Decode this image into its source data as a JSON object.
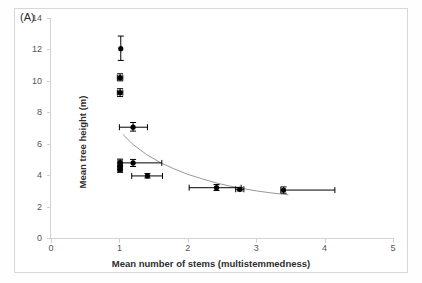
{
  "figure": {
    "panel_label": "(A)",
    "background_color": "#ffffff",
    "frame_color": "#d8d8d8"
  },
  "chart_data": {
    "type": "scatter",
    "title": "",
    "xlabel": "Mean number of stems (multistemmedness)",
    "ylabel": "Mean tree height  (m)",
    "xlim": [
      0,
      5
    ],
    "ylim": [
      0,
      14
    ],
    "xticks": [
      0,
      1,
      2,
      3,
      4,
      5
    ],
    "yticks": [
      0,
      2,
      4,
      6,
      8,
      10,
      12,
      14
    ],
    "grid": false,
    "legend": "none",
    "marker_color": "#000000",
    "errorbar_color": "#000000",
    "fit_line_color": "#8c8c8c",
    "points": [
      {
        "x": 1.02,
        "y": 12.05,
        "xerr_low": 1.02,
        "xerr_high": 1.02,
        "yerr_low": 11.3,
        "yerr_high": 12.85
      },
      {
        "x": 1.01,
        "y": 10.2,
        "xerr_low": 0.97,
        "xerr_high": 1.05,
        "yerr_low": 10.0,
        "yerr_high": 10.45
      },
      {
        "x": 1.01,
        "y": 9.25,
        "xerr_low": 0.97,
        "xerr_high": 1.05,
        "yerr_low": 9.0,
        "yerr_high": 9.5
      },
      {
        "x": 1.2,
        "y": 7.05,
        "xerr_low": 1.0,
        "xerr_high": 1.41,
        "yerr_low": 6.8,
        "yerr_high": 7.35
      },
      {
        "x": 1.01,
        "y": 4.8,
        "xerr_low": 0.98,
        "xerr_high": 1.04,
        "yerr_low": 4.58,
        "yerr_high": 5.02
      },
      {
        "x": 1.01,
        "y": 4.55,
        "xerr_low": 0.98,
        "xerr_high": 1.04,
        "yerr_low": 4.35,
        "yerr_high": 4.78
      },
      {
        "x": 1.01,
        "y": 4.35,
        "xerr_low": 0.98,
        "xerr_high": 1.04,
        "yerr_low": 4.18,
        "yerr_high": 4.55
      },
      {
        "x": 1.2,
        "y": 4.78,
        "xerr_low": 1.02,
        "xerr_high": 1.62,
        "yerr_low": 4.55,
        "yerr_high": 5.0
      },
      {
        "x": 1.41,
        "y": 3.95,
        "xerr_low": 1.18,
        "xerr_high": 1.63,
        "yerr_low": 3.82,
        "yerr_high": 4.1
      },
      {
        "x": 2.42,
        "y": 3.2,
        "xerr_low": 2.02,
        "xerr_high": 2.78,
        "yerr_low": 3.02,
        "yerr_high": 3.4
      },
      {
        "x": 2.76,
        "y": 3.1,
        "xerr_low": 2.7,
        "xerr_high": 2.82,
        "yerr_low": 3.0,
        "yerr_high": 3.22
      },
      {
        "x": 3.4,
        "y": 3.05,
        "xerr_low": 3.36,
        "xerr_high": 4.15,
        "yerr_low": 2.85,
        "yerr_high": 3.25
      }
    ],
    "fit_curve": {
      "description": "decaying power fit",
      "x_start": 1.05,
      "x_end": 3.47,
      "points": [
        {
          "x": 1.05,
          "y": 6.6
        },
        {
          "x": 1.2,
          "y": 5.95
        },
        {
          "x": 1.4,
          "y": 5.3
        },
        {
          "x": 1.6,
          "y": 4.8
        },
        {
          "x": 1.8,
          "y": 4.4
        },
        {
          "x": 2.0,
          "y": 4.05
        },
        {
          "x": 2.2,
          "y": 3.78
        },
        {
          "x": 2.4,
          "y": 3.52
        },
        {
          "x": 2.6,
          "y": 3.32
        },
        {
          "x": 2.8,
          "y": 3.15
        },
        {
          "x": 3.0,
          "y": 3.0
        },
        {
          "x": 3.2,
          "y": 2.88
        },
        {
          "x": 3.47,
          "y": 2.75
        }
      ]
    }
  }
}
